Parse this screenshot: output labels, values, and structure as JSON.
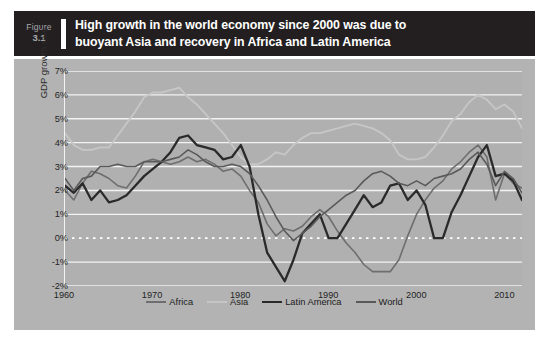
{
  "figure": {
    "label_word": "Figure",
    "number": "3.1",
    "title_line_1": "High growth in the world economy since 2000 was due to",
    "title_line_2": "buoyant Asia and recovery in Africa and Latin America",
    "source": "Source: Centennial Group International (2013)"
  },
  "colors": {
    "title_bar_background": "#231f20",
    "title_text": "#ffffff",
    "figure_number_text": "#a7a9ac",
    "panel_background": "#b3b3b3",
    "plot_background": "#b0b0b0",
    "gridline": "#f2f2f2",
    "zero_line": "#ffffff",
    "africa": "#6e6e6e",
    "asia": "#c6c6c6",
    "latin_america": "#2a2a2a",
    "world": "#5a5a5a"
  },
  "chart_data": {
    "type": "line",
    "title": "High growth in the world economy since 2000 was due to buoyant Asia and recovery in Africa and Latin America",
    "subtitle": "",
    "xlabel": "",
    "ylabel": "GDP growth rate",
    "xlim": [
      1960,
      2012
    ],
    "ylim": [
      -2,
      7
    ],
    "y_tick_labels": [
      "7%",
      "6%",
      "5%",
      "4%",
      "3%",
      "2%",
      "1%",
      "0%",
      "-1%",
      "-2%"
    ],
    "y_ticks": [
      7,
      6,
      5,
      4,
      3,
      2,
      1,
      0,
      -1,
      -2
    ],
    "x_tick_labels": [
      "1960",
      "1970",
      "1980",
      "1990",
      "2000",
      "2010"
    ],
    "x_ticks": [
      1960,
      1970,
      1980,
      1990,
      2000,
      2010
    ],
    "grid": true,
    "grid_axis": "y",
    "zero_line_style": "dotted-white",
    "legend_position": "bottom",
    "legend": [
      "Africa",
      "Asia",
      "Latin America",
      "World"
    ],
    "x": [
      1960,
      1961,
      1962,
      1963,
      1964,
      1965,
      1966,
      1967,
      1968,
      1969,
      1970,
      1971,
      1972,
      1973,
      1974,
      1975,
      1976,
      1977,
      1978,
      1979,
      1980,
      1981,
      1982,
      1983,
      1984,
      1985,
      1986,
      1987,
      1988,
      1989,
      1990,
      1991,
      1992,
      1993,
      1994,
      1995,
      1996,
      1997,
      1998,
      1999,
      2000,
      2001,
      2002,
      2003,
      2004,
      2005,
      2006,
      2007,
      2008,
      2009,
      2010,
      2011,
      2012
    ],
    "series": [
      {
        "name": "Africa",
        "color": "#6e6e6e",
        "width": 1.6,
        "values": [
          2.0,
          1.6,
          2.3,
          2.8,
          2.7,
          2.5,
          2.2,
          2.1,
          2.6,
          3.2,
          3.3,
          3.2,
          3.1,
          3.2,
          3.4,
          3.2,
          3.3,
          3.1,
          2.8,
          2.9,
          2.6,
          2.0,
          1.5,
          0.6,
          0.1,
          0.4,
          0.3,
          0.5,
          0.9,
          1.2,
          0.9,
          0.3,
          -0.2,
          -0.6,
          -1.1,
          -1.4,
          -1.4,
          -1.4,
          -0.9,
          0.1,
          1.0,
          1.6,
          2.1,
          2.4,
          2.9,
          3.2,
          3.6,
          3.9,
          3.4,
          1.6,
          2.7,
          2.3,
          2.1
        ]
      },
      {
        "name": "Asia",
        "color": "#c6c6c6",
        "width": 1.9,
        "values": [
          4.4,
          3.9,
          3.7,
          3.7,
          3.8,
          3.8,
          4.3,
          4.8,
          5.3,
          5.9,
          6.1,
          6.1,
          6.2,
          6.3,
          5.9,
          5.6,
          5.2,
          4.8,
          4.4,
          3.9,
          3.4,
          3.1,
          3.1,
          3.3,
          3.6,
          3.5,
          3.9,
          4.2,
          4.4,
          4.4,
          4.5,
          4.6,
          4.7,
          4.8,
          4.7,
          4.6,
          4.4,
          4.1,
          3.5,
          3.3,
          3.3,
          3.4,
          3.8,
          4.3,
          4.9,
          5.2,
          5.7,
          6.0,
          5.8,
          5.4,
          5.6,
          5.3,
          4.6
        ]
      },
      {
        "name": "Latin America",
        "color": "#2a2a2a",
        "width": 2.3,
        "values": [
          2.2,
          1.9,
          2.3,
          1.6,
          2.0,
          1.5,
          1.6,
          1.8,
          2.2,
          2.6,
          2.9,
          3.2,
          3.6,
          4.2,
          4.3,
          3.9,
          3.8,
          3.7,
          3.3,
          3.4,
          3.9,
          3.0,
          1.0,
          -0.6,
          -1.2,
          -1.8,
          -0.9,
          0.2,
          0.6,
          1.0,
          0.0,
          0.0,
          0.6,
          1.2,
          1.8,
          1.3,
          1.5,
          2.2,
          2.3,
          1.6,
          2.0,
          1.4,
          0.0,
          0.0,
          1.1,
          1.8,
          2.6,
          3.4,
          3.9,
          2.6,
          2.7,
          2.4,
          1.6
        ]
      },
      {
        "name": "World",
        "color": "#5a5a5a",
        "width": 1.6,
        "values": [
          2.5,
          2.0,
          2.5,
          2.6,
          3.0,
          3.0,
          3.1,
          3.0,
          3.0,
          3.2,
          3.2,
          3.2,
          3.3,
          3.4,
          3.7,
          3.5,
          3.2,
          3.0,
          3.0,
          3.1,
          3.0,
          2.7,
          2.2,
          1.6,
          0.9,
          0.3,
          -0.1,
          0.2,
          0.5,
          0.9,
          1.2,
          1.5,
          1.8,
          2.0,
          2.4,
          2.7,
          2.8,
          2.6,
          2.3,
          2.2,
          2.4,
          2.2,
          2.5,
          2.6,
          2.7,
          2.9,
          3.3,
          3.6,
          3.1,
          2.2,
          2.8,
          2.5,
          1.9
        ]
      }
    ]
  }
}
